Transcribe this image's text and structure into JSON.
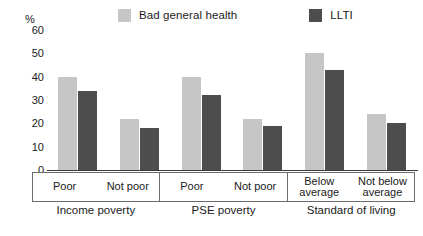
{
  "chart_data": {
    "type": "bar",
    "title": "",
    "subtitle": "",
    "xlabel": "",
    "ylabel": "%",
    "ylim": [
      0,
      60
    ],
    "yticks": [
      0,
      10,
      20,
      30,
      40,
      50,
      60
    ],
    "grid": false,
    "legend_position": "top",
    "categories": [
      "Poor",
      "Not poor",
      "Poor",
      "Not poor",
      "Below average",
      "Not below average"
    ],
    "group_labels": [
      "Income poverty",
      "PSE poverty",
      "Standard of living"
    ],
    "series": [
      {
        "name": "Bad general health",
        "color": "#c6c6c6",
        "values": [
          40,
          22,
          40,
          22,
          50,
          24
        ]
      },
      {
        "name": "LLTI",
        "color": "#4d4d4d",
        "values": [
          34,
          18,
          32,
          19,
          43,
          20
        ]
      }
    ],
    "groups": [
      {
        "label": "Income poverty",
        "categories": [
          {
            "label_lines": [
              "Poor"
            ],
            "bad_general_health": 40,
            "llti": 34
          },
          {
            "label_lines": [
              "Not poor"
            ],
            "bad_general_health": 22,
            "llti": 18
          }
        ]
      },
      {
        "label": "PSE poverty",
        "categories": [
          {
            "label_lines": [
              "Poor"
            ],
            "bad_general_health": 40,
            "llti": 32
          },
          {
            "label_lines": [
              "Not poor"
            ],
            "bad_general_health": 22,
            "llti": 19
          }
        ]
      },
      {
        "label": "Standard of living",
        "categories": [
          {
            "label_lines": [
              "Below",
              "average"
            ],
            "bad_general_health": 50,
            "llti": 43
          },
          {
            "label_lines": [
              "Not below",
              "average"
            ],
            "bad_general_health": 24,
            "llti": 20
          }
        ]
      }
    ]
  },
  "legend": {
    "entries": [
      {
        "label": "Bad general health",
        "color": "#c6c6c6"
      },
      {
        "label": "LLTI",
        "color": "#4d4d4d"
      }
    ]
  },
  "axis": {
    "unit_label": "%",
    "ticks": [
      "60",
      "50",
      "40",
      "30",
      "20",
      "10",
      "0"
    ]
  },
  "colors": {
    "light_bar": "#c6c6c6",
    "dark_bar": "#4d4d4d",
    "axis_line": "#3a3a3a",
    "box_border": "#6d6d6d",
    "text": "#1a1a1a",
    "background": "#ffffff"
  }
}
